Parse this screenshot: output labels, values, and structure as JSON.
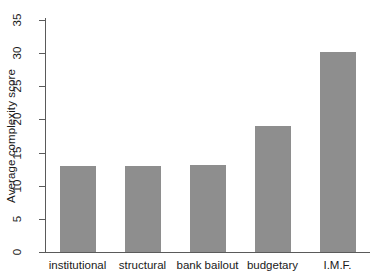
{
  "chart_data": {
    "type": "bar",
    "title": "",
    "subtitle": "",
    "xlabel": "",
    "ylabel": "Average complexity score",
    "categories": [
      "institutional",
      "structural",
      "bank bailout",
      "budgetary",
      "I.M.F."
    ],
    "values": [
      13.0,
      13.0,
      13.1,
      19.0,
      30.2
    ],
    "series": [
      {
        "name": "Average complexity score",
        "values": [
          13.0,
          13.0,
          13.1,
          19.0,
          30.2
        ]
      }
    ],
    "ylim": [
      0,
      35
    ],
    "yticks": [
      0,
      5,
      10,
      15,
      20,
      25,
      30,
      35
    ],
    "ytick_labels": [
      "0",
      "5",
      "10",
      "15",
      "20",
      "25",
      "30",
      "35"
    ],
    "grid": false,
    "legend": false,
    "legend_position": "none",
    "bar_color": "#8e8e8e",
    "axis_color": "#5a5a5a",
    "background_color": "#ffffff",
    "text_color": "#1a1a1a",
    "annotations": []
  }
}
